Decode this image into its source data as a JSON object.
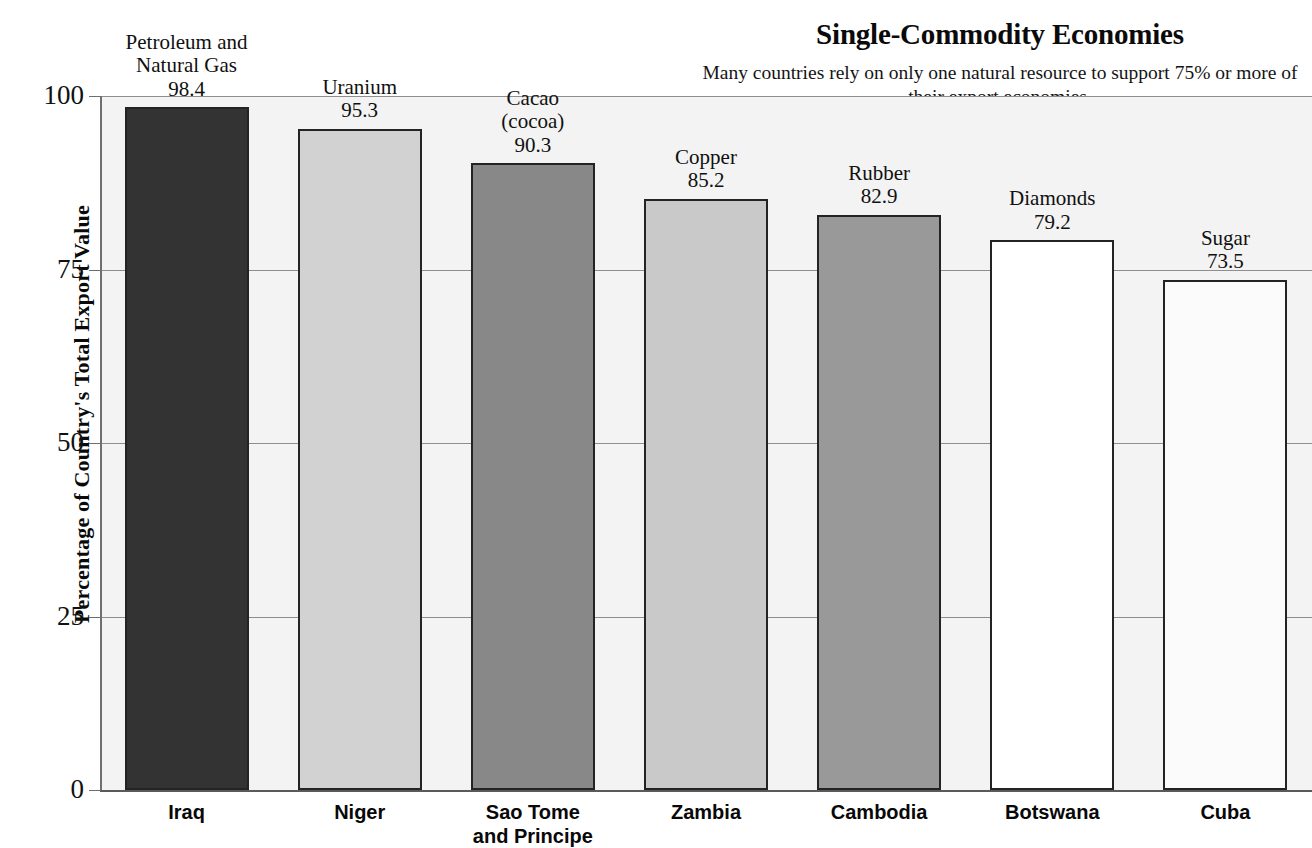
{
  "header": {
    "title": "Single-Commodity Economies",
    "subtitle": "Many countries rely on only one natural resource\nto support 75% or more of their export economies."
  },
  "axes": {
    "y_title": "Percentage of Country's Total Export Value",
    "y_ticks": [
      "100",
      "75",
      "50",
      "25",
      "0"
    ]
  },
  "chart_data": {
    "type": "bar",
    "title": "Single-Commodity Economies",
    "subtitle": "Many countries rely on only one natural resource to support 75% or more of their export economies.",
    "xlabel": "",
    "ylabel": "Percentage of Country's Total Export Value",
    "ylim": [
      0,
      100
    ],
    "yticks": [
      0,
      25,
      50,
      75,
      100
    ],
    "grid": true,
    "legend": "none",
    "categories": [
      "Iraq",
      "Niger",
      "Sao Tome\nand Principe",
      "Zambia",
      "Cambodia",
      "Botswana",
      "Cuba"
    ],
    "values": [
      98.4,
      95.3,
      90.3,
      85.2,
      82.9,
      79.2,
      73.5
    ],
    "commodities": [
      "Petroleum and\nNatural Gas",
      "Uranium",
      "Cacao\n(cocoa)",
      "Copper",
      "Rubber",
      "Diamonds",
      "Sugar"
    ],
    "value_labels": [
      "98.4",
      "95.3",
      "90.3",
      "85.2",
      "82.9",
      "79.2",
      "73.5"
    ],
    "bar_colors": [
      "#333333",
      "#d2d2d2",
      "#888888",
      "#c9c9c9",
      "#999999",
      "#ffffff",
      "#fbfbfb"
    ]
  },
  "bars": [
    {
      "country": "Iraq",
      "commodity": "Petroleum and\nNatural Gas",
      "value_label": "98.4",
      "value": 98.4,
      "color": "#333333"
    },
    {
      "country": "Niger",
      "commodity": "Uranium",
      "value_label": "95.3",
      "value": 95.3,
      "color": "#d2d2d2"
    },
    {
      "country": "Sao Tome\nand Principe",
      "commodity": "Cacao\n(cocoa)",
      "value_label": "90.3",
      "value": 90.3,
      "color": "#888888"
    },
    {
      "country": "Zambia",
      "commodity": "Copper",
      "value_label": "85.2",
      "value": 85.2,
      "color": "#c9c9c9"
    },
    {
      "country": "Cambodia",
      "commodity": "Rubber",
      "value_label": "82.9",
      "value": 82.9,
      "color": "#999999"
    },
    {
      "country": "Botswana",
      "commodity": "Diamonds",
      "value_label": "79.2",
      "value": 79.2,
      "color": "#ffffff"
    },
    {
      "country": "Cuba",
      "commodity": "Sugar",
      "value_label": "73.5",
      "value": 73.5,
      "color": "#fbfbfb"
    }
  ]
}
